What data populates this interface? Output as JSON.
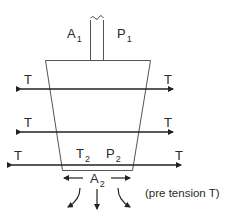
{
  "diagram": {
    "title": "",
    "colors": {
      "outline": "#555555",
      "arrow": "#222222",
      "text": "#2a2a2a",
      "background": "#ffffff"
    },
    "labels": {
      "a1": {
        "main": "A",
        "sub": "1"
      },
      "p1": {
        "main": "P",
        "sub": "1"
      },
      "t2": {
        "main": "T",
        "sub": "2"
      },
      "p2": {
        "main": "P",
        "sub": "2"
      },
      "a2": {
        "main": "A",
        "sub": "2"
      },
      "tension_left_1": "T",
      "tension_right_1": "T",
      "tension_left_2": "T",
      "tension_right_2": "T",
      "tension_left_3": "T",
      "tension_right_3": "T"
    },
    "note": "(pre tension T)",
    "shapes": {
      "piston_rod": "rod with wavy break at top",
      "vessel": "inverted trapezoid (wide top, narrow bottom)",
      "tension_lines": 3,
      "outflow_arrows": 3
    }
  }
}
